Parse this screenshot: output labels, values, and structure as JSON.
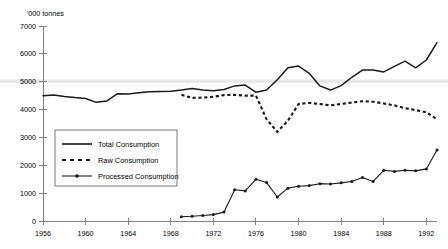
{
  "chart_data": {
    "type": "line",
    "title": "",
    "ylabel": "'000 tonnes",
    "xlabel": "",
    "ylim": [
      0,
      7000
    ],
    "xlim": [
      1956,
      1993
    ],
    "grid": false,
    "legend_position": "inner-left-middle",
    "y_ticks": [
      "0",
      "1000",
      "2000",
      "3000",
      "4000",
      "5000",
      "6000",
      "7000"
    ],
    "y_tick_values": [
      0,
      1000,
      2000,
      3000,
      4000,
      5000,
      6000,
      7000
    ],
    "x_ticks": [
      "1956",
      "1960",
      "1964",
      "1968",
      "1972",
      "1976",
      "1980",
      "1984",
      "1988",
      "1992"
    ],
    "x_tick_values": [
      1956,
      1960,
      1964,
      1968,
      1972,
      1976,
      1980,
      1984,
      1988,
      1992
    ],
    "highlight_band": {
      "from": 4950,
      "to": 5080,
      "color": "#e8e8e8"
    },
    "series": [
      {
        "name": "Total Consumption",
        "style": "solid",
        "color": "#1a1a1a",
        "markers": false,
        "x": [
          1956,
          1957,
          1958,
          1959,
          1960,
          1961,
          1962,
          1963,
          1964,
          1965,
          1966,
          1967,
          1968,
          1969,
          1970,
          1971,
          1972,
          1973,
          1974,
          1975,
          1976,
          1977,
          1978,
          1979,
          1980,
          1981,
          1982,
          1983,
          1984,
          1985,
          1986,
          1987,
          1988,
          1989,
          1990,
          1991,
          1992,
          1993
        ],
        "values": [
          4500,
          4520,
          4470,
          4430,
          4400,
          4260,
          4310,
          4570,
          4560,
          4600,
          4640,
          4650,
          4660,
          4700,
          4760,
          4700,
          4680,
          4720,
          4850,
          4880,
          4620,
          4700,
          5070,
          5500,
          5560,
          5300,
          4850,
          4700,
          4860,
          5160,
          5420,
          5420,
          5350,
          5550,
          5740,
          5500,
          5780,
          6400
        ]
      },
      {
        "name": "Raw Consumption",
        "style": "dashed",
        "color": "#1a1a1a",
        "markers": false,
        "x": [
          1969,
          1970,
          1971,
          1972,
          1973,
          1974,
          1975,
          1976,
          1977,
          1978,
          1979,
          1980,
          1981,
          1982,
          1983,
          1984,
          1985,
          1986,
          1987,
          1988,
          1989,
          1990,
          1991,
          1992,
          1993
        ],
        "values": [
          4530,
          4420,
          4430,
          4460,
          4520,
          4530,
          4500,
          4500,
          3650,
          3200,
          3600,
          4200,
          4240,
          4200,
          4150,
          4200,
          4250,
          4300,
          4280,
          4220,
          4150,
          4050,
          3980,
          3900,
          3650
        ]
      },
      {
        "name": "Processed Consumption",
        "style": "solid-markers",
        "color": "#1a1a1a",
        "markers": true,
        "x": [
          1969,
          1970,
          1971,
          1972,
          1973,
          1974,
          1975,
          1976,
          1977,
          1978,
          1979,
          1980,
          1981,
          1982,
          1983,
          1984,
          1985,
          1986,
          1987,
          1988,
          1989,
          1990,
          1991,
          1992,
          1993
        ],
        "values": [
          150,
          170,
          200,
          230,
          320,
          1120,
          1080,
          1500,
          1380,
          860,
          1180,
          1250,
          1270,
          1340,
          1330,
          1370,
          1420,
          1560,
          1420,
          1820,
          1780,
          1820,
          1800,
          1870,
          2550
        ]
      }
    ]
  },
  "legend": {
    "items": [
      {
        "label": "Total Consumption",
        "style": "solid"
      },
      {
        "label": "Raw Consumption",
        "style": "dashed"
      },
      {
        "label": "Processed Consumption",
        "style": "solid-markers"
      }
    ]
  }
}
